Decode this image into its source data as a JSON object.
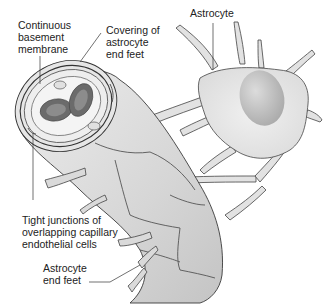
{
  "diagram": {
    "labels": {
      "continuous_basement_membrane": "Continuous\nbasement\nmembrane",
      "covering_astrocyte_end_feet": "Covering of\nastrocyte\nend feet",
      "astrocyte": "Astrocyte",
      "tight_junctions": "Tight junctions of\noverlapping capillary\nendothelial cells",
      "astrocyte_end_feet": "Astrocyte\nend feet"
    },
    "colors": {
      "background": "#ffffff",
      "cell_fill": "#e4e4e4",
      "cell_shade": "#c9c9c9",
      "outline": "#3a3a3a",
      "lumen": "#f2f2f2",
      "rbc_outer": "#6e6e6e",
      "rbc_inner": "#8a8a8a",
      "nucleus": "#bdbdbd",
      "text": "#222222"
    }
  }
}
